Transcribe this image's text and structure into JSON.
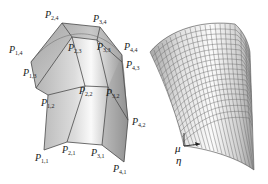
{
  "figure": {
    "left_panel": {
      "description": "Control polygon with control points over bicubic patch",
      "labels": [
        {
          "id": "P14",
          "letter": "P",
          "sub": "1,4",
          "x": 9,
          "y": 53
        },
        {
          "id": "P24",
          "letter": "P",
          "sub": "2,4",
          "x": 45,
          "y": 18
        },
        {
          "id": "P34",
          "letter": "P",
          "sub": "3,4",
          "x": 93,
          "y": 22
        },
        {
          "id": "P44",
          "letter": "P",
          "sub": "4,4",
          "x": 124,
          "y": 50
        },
        {
          "id": "P23",
          "letter": "P",
          "sub": "2,3",
          "x": 68,
          "y": 51
        },
        {
          "id": "P33",
          "letter": "P",
          "sub": "3,3",
          "x": 97,
          "y": 50
        },
        {
          "id": "P43",
          "letter": "P",
          "sub": "4,3",
          "x": 126,
          "y": 68
        },
        {
          "id": "P13",
          "letter": "P",
          "sub": "1,3",
          "x": 23,
          "y": 76
        },
        {
          "id": "P22",
          "letter": "P",
          "sub": "2,2",
          "x": 79,
          "y": 94
        },
        {
          "id": "P32",
          "letter": "P",
          "sub": "3,2",
          "x": 106,
          "y": 96
        },
        {
          "id": "P12",
          "letter": "P",
          "sub": "1,2",
          "x": 41,
          "y": 106
        },
        {
          "id": "P42",
          "letter": "P",
          "sub": "4,2",
          "x": 132,
          "y": 125
        },
        {
          "id": "P11",
          "letter": "P",
          "sub": "1,1",
          "x": 35,
          "y": 161
        },
        {
          "id": "P21",
          "letter": "P",
          "sub": "2,1",
          "x": 62,
          "y": 153
        },
        {
          "id": "P31",
          "letter": "P",
          "sub": "3,1",
          "x": 91,
          "y": 156
        },
        {
          "id": "P41",
          "letter": "P",
          "sub": "4,1",
          "x": 113,
          "y": 172
        }
      ]
    },
    "right_panel": {
      "description": "Resulting smooth surface with parametric grid",
      "axis_labels": {
        "mu": "μ",
        "eta": "η"
      },
      "grid_u": 16,
      "grid_v": 24
    },
    "colors": {
      "surface_light": "#f4f4f4",
      "surface_mid": "#c8c8c8",
      "surface_dark": "#8e8e8e",
      "edge": "#555555",
      "grid": "#6a6a6a"
    }
  }
}
